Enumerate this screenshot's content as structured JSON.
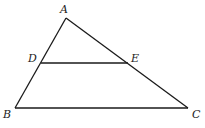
{
  "diagram": {
    "type": "triangle with parallel segment",
    "points": {
      "A": {
        "label": "A",
        "x": 66,
        "y": 18,
        "lx": 60,
        "ly": 13
      },
      "B": {
        "label": "B",
        "x": 15,
        "y": 108,
        "lx": 3,
        "ly": 118
      },
      "C": {
        "label": "C",
        "x": 188,
        "y": 108,
        "lx": 192,
        "ly": 118
      },
      "D": {
        "label": "D",
        "x": 41,
        "y": 63,
        "lx": 28,
        "ly": 62
      },
      "E": {
        "label": "E",
        "x": 128,
        "y": 63,
        "lx": 131,
        "ly": 62
      }
    },
    "segments": [
      "AB",
      "AC",
      "BC",
      "DE"
    ]
  }
}
